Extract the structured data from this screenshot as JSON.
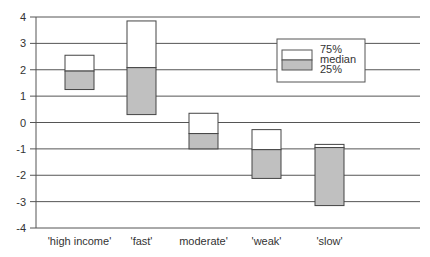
{
  "chart_data": {
    "type": "bar",
    "subtype": "floating-box",
    "title": "",
    "xlabel": "",
    "ylabel": "",
    "ylim": [
      -4,
      4
    ],
    "yticks": [
      4,
      3,
      2,
      1,
      0,
      -1,
      -2,
      -3,
      -4
    ],
    "grid": true,
    "legend_position": "upper-right",
    "categories": [
      "'high income'",
      "'fast'",
      "moderate'",
      "'weak'",
      "'slow'"
    ],
    "series": [
      {
        "name": "75%",
        "values": [
          2.55,
          3.85,
          0.35,
          -0.27,
          -0.83
        ]
      },
      {
        "name": "median",
        "values": [
          1.95,
          2.08,
          -0.42,
          -1.03,
          -0.95
        ]
      },
      {
        "name": "25%",
        "values": [
          1.25,
          0.3,
          -1.0,
          -2.12,
          -3.15
        ]
      }
    ],
    "legend": [
      "75%",
      "median",
      "25%"
    ],
    "colors": {
      "upper": "#ffffff",
      "lower": "#c0c0c0",
      "stroke": "#444444",
      "grid": "#555555"
    }
  }
}
